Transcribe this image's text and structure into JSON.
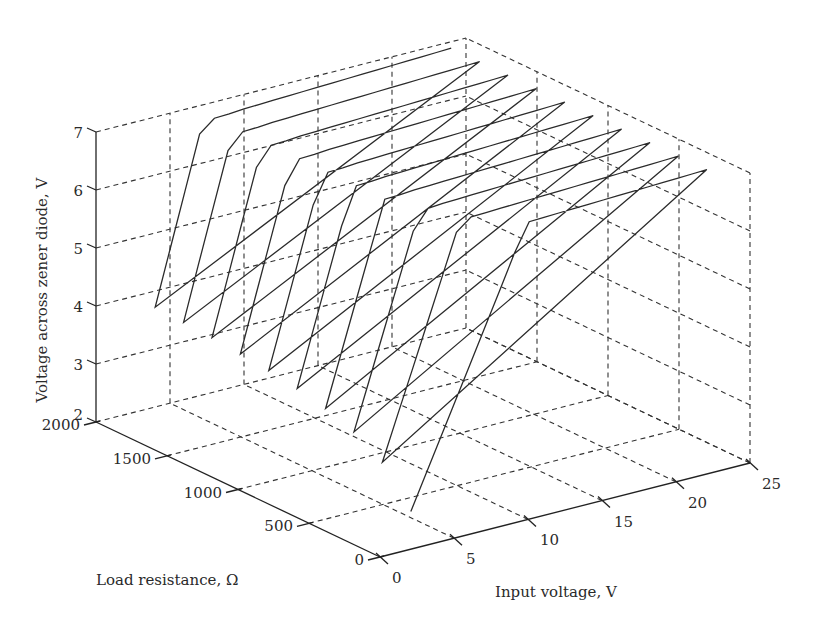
{
  "chart_data": {
    "type": "line",
    "subtype": "3d-line",
    "title": "",
    "xlabel": "Input voltage, V",
    "ylabel": "Load resistance, Ω",
    "zlabel": "Voltage across zener diode, V",
    "x_axis": {
      "name": "Input voltage",
      "range": [
        0,
        25
      ],
      "ticks": [
        0,
        5,
        10,
        15,
        20,
        25
      ]
    },
    "y_axis": {
      "name": "Load resistance",
      "range": [
        0,
        2000
      ],
      "ticks": [
        0,
        500,
        1000,
        1500,
        2000
      ]
    },
    "z_axis": {
      "name": "Voltage across zener diode",
      "range": [
        2,
        7
      ],
      "ticks": [
        2,
        3,
        4,
        5,
        6,
        7
      ]
    },
    "grid": true,
    "legend": null,
    "x": [
      4,
      5,
      6,
      7,
      8,
      9,
      10,
      11,
      12,
      13,
      14,
      15,
      16,
      17,
      18,
      19,
      20,
      21,
      22,
      23,
      24
    ],
    "series": [
      {
        "name": "R = 200 Ω",
        "R": 200,
        "values": [
          2.29,
          2.86,
          3.43,
          4.0,
          4.57,
          5.14,
          5.71,
          6.29,
          6.77,
          6.78,
          6.79,
          6.8,
          6.81,
          6.82,
          6.83,
          6.84,
          6.85,
          6.86,
          6.87,
          6.88,
          6.89
        ]
      },
      {
        "name": "R = 400 Ω",
        "R": 400,
        "values": [
          2.91,
          3.64,
          4.36,
          5.09,
          5.82,
          6.55,
          6.75,
          6.76,
          6.77,
          6.78,
          6.79,
          6.8,
          6.81,
          6.82,
          6.83,
          6.84,
          6.85,
          6.86,
          6.87,
          6.88,
          6.89
        ]
      },
      {
        "name": "R = 600 Ω",
        "R": 600,
        "values": [
          3.2,
          4.0,
          4.8,
          5.6,
          6.4,
          6.73,
          6.75,
          6.76,
          6.77,
          6.78,
          6.79,
          6.8,
          6.81,
          6.82,
          6.83,
          6.84,
          6.85,
          6.86,
          6.87,
          6.88,
          6.89
        ]
      },
      {
        "name": "R = 800 Ω",
        "R": 800,
        "values": [
          3.37,
          4.21,
          5.05,
          5.89,
          6.72,
          6.73,
          6.75,
          6.76,
          6.77,
          6.78,
          6.79,
          6.8,
          6.81,
          6.82,
          6.83,
          6.84,
          6.85,
          6.86,
          6.87,
          6.88,
          6.89
        ]
      },
      {
        "name": "R = 1000 Ω",
        "R": 1000,
        "values": [
          3.48,
          4.35,
          5.22,
          6.09,
          6.72,
          6.73,
          6.75,
          6.76,
          6.77,
          6.78,
          6.79,
          6.8,
          6.81,
          6.82,
          6.83,
          6.84,
          6.85,
          6.86,
          6.87,
          6.88,
          6.89
        ]
      },
      {
        "name": "R = 1200 Ω",
        "R": 1200,
        "values": [
          3.56,
          4.44,
          5.33,
          6.22,
          6.72,
          6.73,
          6.75,
          6.76,
          6.77,
          6.78,
          6.79,
          6.8,
          6.81,
          6.82,
          6.83,
          6.84,
          6.85,
          6.86,
          6.87,
          6.88,
          6.89
        ]
      },
      {
        "name": "R = 1400 Ω",
        "R": 1400,
        "values": [
          3.61,
          4.52,
          5.42,
          6.32,
          6.72,
          6.73,
          6.75,
          6.76,
          6.77,
          6.78,
          6.79,
          6.8,
          6.81,
          6.82,
          6.83,
          6.84,
          6.85,
          6.86,
          6.87,
          6.88,
          6.89
        ]
      },
      {
        "name": "R = 1600 Ω",
        "R": 1600,
        "values": [
          3.66,
          4.57,
          5.49,
          6.4,
          6.72,
          6.73,
          6.75,
          6.76,
          6.77,
          6.78,
          6.79,
          6.8,
          6.81,
          6.82,
          6.83,
          6.84,
          6.85,
          6.86,
          6.87,
          6.88,
          6.89
        ]
      },
      {
        "name": "R = 1800 Ω",
        "R": 1800,
        "values": [
          3.69,
          4.62,
          5.54,
          6.46,
          6.72,
          6.73,
          6.75,
          6.76,
          6.77,
          6.78,
          6.79,
          6.8,
          6.81,
          6.82,
          6.83,
          6.84,
          6.85,
          6.86,
          6.87,
          6.88,
          6.89
        ]
      },
      {
        "name": "R = 2000 Ω",
        "R": 2000,
        "values": [
          3.72,
          4.65,
          5.58,
          6.51,
          6.72,
          6.73,
          6.75,
          6.76,
          6.77,
          6.78,
          6.79,
          6.8,
          6.81,
          6.82,
          6.83,
          6.84,
          6.85,
          6.86,
          6.87,
          6.88,
          6.89
        ]
      }
    ],
    "series_connected_as_single_polyline": true
  },
  "labels": {
    "xlabel": "Input voltage, V",
    "ylabel": "Load resistance, Ω",
    "zlabel": "Voltage across zener diode, V",
    "x_ticks": [
      "0",
      "5",
      "10",
      "15",
      "20",
      "25"
    ],
    "y_ticks": [
      "0",
      "500",
      "1000",
      "1500",
      "2000"
    ],
    "z_ticks": [
      "2",
      "3",
      "4",
      "5",
      "6",
      "7"
    ]
  },
  "style": {
    "line_color": "#2b2b2b",
    "grid_color": "#333333",
    "background": "#ffffff"
  }
}
